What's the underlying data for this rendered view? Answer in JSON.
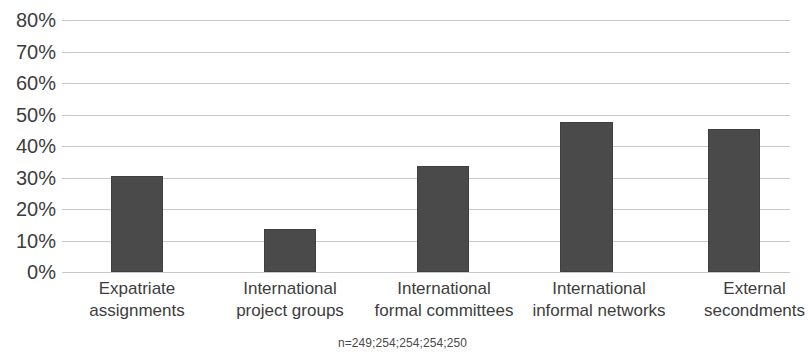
{
  "chart_data": {
    "type": "bar",
    "title": "",
    "subtitle": "",
    "xlabel": "",
    "ylabel": "",
    "categories": [
      "Expatriate assignments",
      "International project groups",
      "International formal committees",
      "International informal networks",
      "External secondments"
    ],
    "category_lines": [
      [
        "Expatriate",
        "assignments"
      ],
      [
        "International",
        "project groups"
      ],
      [
        "International",
        "formal committees"
      ],
      [
        "International",
        "informal networks"
      ],
      [
        "External",
        "secondments"
      ]
    ],
    "values": [
      30.5,
      13.7,
      33.5,
      47.5,
      45.5
    ],
    "value_labels": [
      "30.5%",
      "13.7%",
      "33.5%",
      "47.5%",
      "45.5%"
    ],
    "ylim": [
      0,
      80
    ],
    "ytick_values": [
      80,
      70,
      60,
      50,
      40,
      30,
      20,
      10,
      0
    ],
    "ytick_labels": [
      "80%",
      "70%",
      "60%",
      "50%",
      "40%",
      "30%",
      "20%",
      "10%",
      "0%"
    ],
    "grid": true,
    "legend": null,
    "legend_position": "none",
    "bar_color": "#4a4a4a",
    "gridline_color": "#c9c9cd",
    "background_color": "#ffffff",
    "annotations": [
      {
        "name": "sample-size-note",
        "text": "n=249;254;254;254;250"
      }
    ]
  },
  "footnote": {
    "sample_sizes": "n=249;254;254;254;250"
  }
}
